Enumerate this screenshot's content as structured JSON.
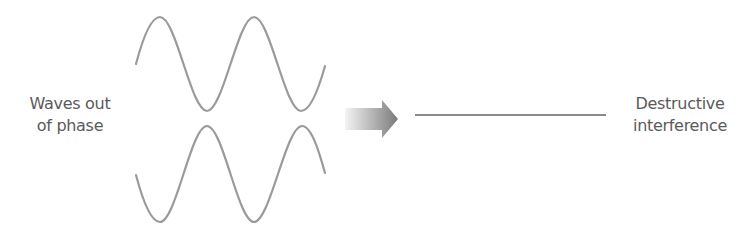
{
  "labels": {
    "input": {
      "line1": "Waves out",
      "line2": "of phase"
    },
    "output": {
      "line1": "Destructive",
      "line2": "interference"
    }
  },
  "colors": {
    "wave": "#9a9a9a",
    "result_line": "#8a8a8a",
    "arrow_start": "#f2f2f2",
    "arrow_end": "#7a7a7a",
    "text": "#5a5a5a"
  },
  "icons": {
    "arrow": "right-arrow-icon"
  }
}
